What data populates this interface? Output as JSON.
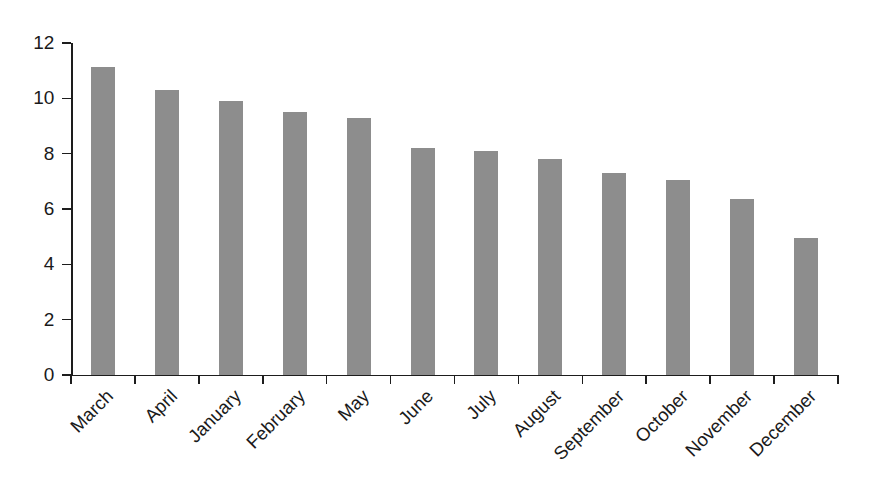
{
  "chart_data": {
    "type": "bar",
    "title": "",
    "subtitle": "",
    "xlabel": "",
    "ylabel": "",
    "categories": [
      "March",
      "April",
      "January",
      "February",
      "May",
      "June",
      "July",
      "August",
      "September",
      "October",
      "November",
      "December"
    ],
    "values": [
      11.15,
      10.3,
      9.9,
      9.5,
      9.3,
      8.2,
      8.1,
      7.8,
      7.3,
      7.05,
      6.35,
      4.95
    ],
    "ylim": [
      0,
      12
    ],
    "yticks": [
      0,
      2,
      4,
      6,
      8,
      10,
      12
    ],
    "ytick_labels": [
      "0",
      "2",
      "4",
      "6",
      "8",
      "10",
      "12"
    ],
    "xlim": [
      0,
      12
    ],
    "grid": false,
    "legend": null,
    "annotations": [],
    "bar_color": "#8d8d8d",
    "axis_color": "#1d1d1d",
    "background_color": "#ffffff",
    "xtick_label_rotation": -45,
    "sorted": "descending"
  }
}
